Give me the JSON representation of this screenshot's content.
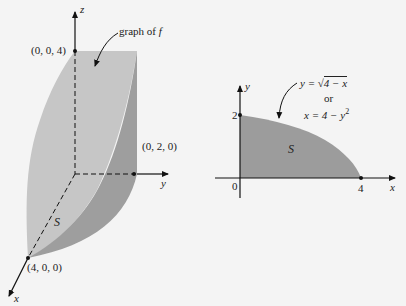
{
  "left_figure": {
    "axes": {
      "x": "x",
      "y": "y",
      "z": "z"
    },
    "points": {
      "z_intercept": "(0, 0, 4)",
      "y_intercept": "(0, 2, 0)",
      "x_intercept": "(4, 0, 0)"
    },
    "annotation": {
      "prefix": "graph of ",
      "fn": "f"
    },
    "region_label": "S",
    "colors": {
      "surface_front": "#c6c6c6",
      "surface_side": "#9e9e9e",
      "surface_bottom": "#adadad"
    }
  },
  "right_figure": {
    "axes": {
      "x": "x",
      "y": "y"
    },
    "ticks": {
      "origin": "0",
      "y_tick": "2",
      "x_tick": "4"
    },
    "equation_1": {
      "lhs": "y = ",
      "radical": "4 − x"
    },
    "equation_or": "or",
    "equation_2": {
      "lhs": "x = 4 − y",
      "exp": "2"
    },
    "region_label": "S",
    "colors": {
      "region": "#9c9c9c"
    }
  }
}
